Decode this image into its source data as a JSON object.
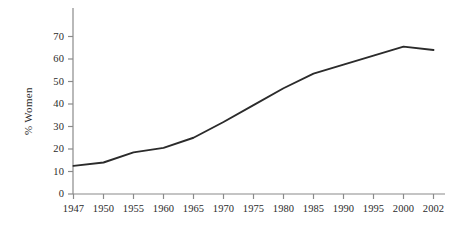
{
  "chart_data": {
    "type": "line",
    "title": "",
    "subtitle": "",
    "xlabel": "",
    "ylabel": "% Women",
    "categories": [
      "1947",
      "1950",
      "1955",
      "1960",
      "1965",
      "1970",
      "1975",
      "1980",
      "1985",
      "1990",
      "1995",
      "2000",
      "2002"
    ],
    "values": [
      12.5,
      14,
      18.5,
      20.5,
      25,
      32,
      39.5,
      47,
      53.5,
      57.5,
      61.5,
      65.5,
      64
    ],
    "series": [
      {
        "name": "% Women",
        "values": [
          12.5,
          14,
          18.5,
          20.5,
          25,
          32,
          39.5,
          47,
          53.5,
          57.5,
          61.5,
          65.5,
          64
        ]
      }
    ],
    "x_tick_labels": [
      "1947",
      "1950",
      "1955",
      "1960",
      "1965",
      "1970",
      "1975",
      "1980",
      "1985",
      "1990",
      "1995",
      "2000",
      "2002"
    ],
    "y_tick_labels": [
      "0",
      "10",
      "20",
      "30",
      "40",
      "50",
      "60",
      "70"
    ],
    "y_ticks": [
      0,
      10,
      20,
      30,
      40,
      50,
      60,
      70
    ],
    "ylim": [
      0,
      72
    ],
    "grid": false,
    "legend": false,
    "legend_position": "none",
    "line_color": "#2b2b2b",
    "axis_color": "#8a8a8a",
    "background_color": "#ffffff"
  }
}
